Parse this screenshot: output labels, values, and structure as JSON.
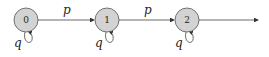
{
  "diagram": {
    "type": "state-machine",
    "nodes": [
      {
        "id": "0",
        "label": "0",
        "fill": "#d3d3d3"
      },
      {
        "id": "1",
        "label": "1",
        "fill": "#d3d3d3"
      },
      {
        "id": "2",
        "label": "2",
        "fill": "#d3d3d3"
      }
    ],
    "edges": [
      {
        "from": "0",
        "to": "1",
        "label": "p"
      },
      {
        "from": "1",
        "to": "2",
        "label": "p"
      },
      {
        "from": "2",
        "to": "out",
        "label": ""
      }
    ],
    "self_loops": [
      {
        "node": "0",
        "label": "q"
      },
      {
        "node": "1",
        "label": "q"
      },
      {
        "node": "2",
        "label": "q"
      }
    ]
  }
}
